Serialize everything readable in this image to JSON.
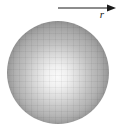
{
  "figure": {
    "arrow_label": "r",
    "arrow_direction": "right"
  },
  "icons": {
    "radius_arrow": "right-arrow-icon"
  },
  "colors": {
    "background": "#ffffff",
    "sphere_base": "#949494",
    "sphere_highlight": "#fafafa",
    "arrow_color": "#1a1a1a"
  }
}
